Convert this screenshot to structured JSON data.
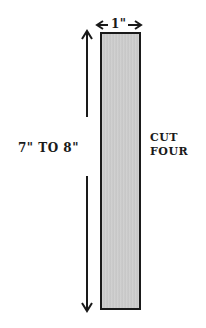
{
  "diagram": {
    "width_label": "1\"",
    "length_label": "7\" TO 8\"",
    "instruction_line1": "CUT",
    "instruction_line2": "FOUR",
    "fill_color": "#cccccc",
    "line_color": "#1a1a1a"
  }
}
